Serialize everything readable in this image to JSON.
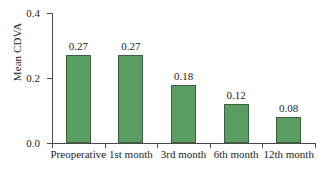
{
  "chart_data": {
    "type": "bar",
    "title": "",
    "xlabel": "",
    "ylabel": "Mean CDVA",
    "categories": [
      "Preoperative",
      "1st month",
      "3rd month",
      "6th month",
      "12th month"
    ],
    "values": [
      0.27,
      0.27,
      0.18,
      0.12,
      0.08
    ],
    "value_labels": [
      "0.27",
      "0.27",
      "0.18",
      "0.12",
      "0.08"
    ],
    "ylim": [
      0.0,
      0.4
    ],
    "ytick_labels": [
      "0.0",
      "0.2",
      "0.4"
    ],
    "ytick_values": [
      0.0,
      0.2,
      0.4
    ],
    "grid": false,
    "legend": "none",
    "bar_color": "#5a9d63",
    "bar_edge_color": "#3b5f3f",
    "axis_color": "#4a4a4a",
    "background_color": "#ffffff"
  }
}
